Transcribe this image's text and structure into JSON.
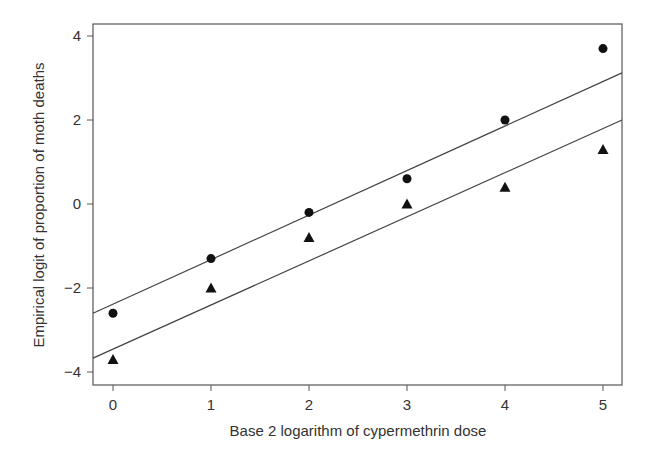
{
  "chart_data": {
    "type": "scatter",
    "title": "",
    "xlabel": "Base 2 logarithm of cypermethrin dose",
    "ylabel": "Empirical logit of proportion of moth deaths",
    "xlim": [
      -0.2,
      5.2
    ],
    "ylim": [
      -4.3,
      4.4
    ],
    "xticks": [
      0,
      1,
      2,
      3,
      4,
      5
    ],
    "yticks": [
      -4,
      -2,
      0,
      2,
      4
    ],
    "grid": false,
    "legend": null,
    "series": [
      {
        "name": "circles",
        "marker": "circle",
        "x": [
          0,
          1,
          2,
          3,
          4,
          5
        ],
        "y": [
          -2.6,
          -1.3,
          -0.2,
          0.6,
          2.0,
          3.7
        ],
        "fit_line": {
          "intercept": -2.39,
          "slope": 1.06
        }
      },
      {
        "name": "triangles",
        "marker": "triangle",
        "x": [
          0,
          1,
          2,
          3,
          4,
          5
        ],
        "y": [
          -3.7,
          -2.0,
          -0.8,
          0.0,
          0.4,
          1.3
        ],
        "fit_line": {
          "intercept": -3.46,
          "slope": 1.05
        }
      }
    ]
  }
}
